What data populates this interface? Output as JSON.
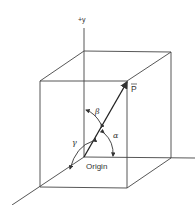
{
  "diagram": {
    "type": "3d-vector-direction-angles",
    "axis_labels": {
      "y": "+y"
    },
    "vector_label": "P",
    "origin_label": "Origin",
    "angles": {
      "alpha": "α",
      "beta": "β",
      "gamma": "γ"
    },
    "colors": {
      "line": "#333333",
      "background": "#ffffff"
    }
  }
}
